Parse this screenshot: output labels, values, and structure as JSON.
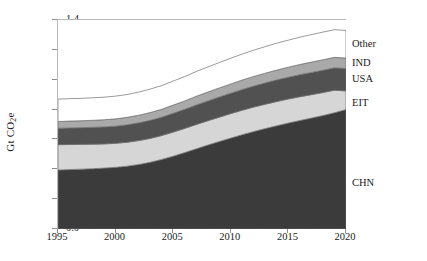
{
  "chart_data": {
    "type": "area",
    "stacked": true,
    "title": "",
    "xlabel": "",
    "ylabel": "Gt CO2e",
    "ylabel_parts": {
      "prefix": "Gt CO",
      "sub": "2",
      "suffix": "e"
    },
    "x": [
      1995,
      1996,
      1997,
      1998,
      1999,
      2000,
      2001,
      2002,
      2003,
      2004,
      2005,
      2006,
      2007,
      2008,
      2009,
      2010,
      2011,
      2012,
      2013,
      2014,
      2015,
      2016,
      2017,
      2018,
      2019,
      2020
    ],
    "xlim": [
      1995,
      2020
    ],
    "ylim": [
      0.0,
      1.4
    ],
    "xticks": [
      "1995",
      "2000",
      "2005",
      "2010",
      "2015",
      "2020"
    ],
    "xtick_values": [
      1995,
      2000,
      2005,
      2010,
      2015,
      2020
    ],
    "yticks": [
      "0.0",
      "0.2",
      "0.4",
      "0.6",
      "0.8",
      "1.0",
      "1.2",
      "1.4"
    ],
    "ytick_values": [
      0.0,
      0.2,
      0.4,
      0.6,
      0.8,
      1.0,
      1.2,
      1.4
    ],
    "grid": false,
    "legend_position": "right-inline-labels",
    "series": [
      {
        "name": "CHN",
        "color": "#3b3b3b",
        "label_value": 0.3,
        "values": [
          0.395,
          0.398,
          0.401,
          0.404,
          0.408,
          0.413,
          0.421,
          0.432,
          0.447,
          0.466,
          0.488,
          0.512,
          0.537,
          0.562,
          0.586,
          0.609,
          0.632,
          0.653,
          0.673,
          0.692,
          0.71,
          0.727,
          0.743,
          0.76,
          0.779,
          0.8
        ]
      },
      {
        "name": "EIT",
        "color": "#d6d6d6",
        "label_value": 0.835,
        "values": [
          0.17,
          0.168,
          0.166,
          0.164,
          0.162,
          0.161,
          0.16,
          0.16,
          0.16,
          0.16,
          0.161,
          0.162,
          0.163,
          0.163,
          0.163,
          0.164,
          0.164,
          0.164,
          0.163,
          0.162,
          0.161,
          0.159,
          0.157,
          0.154,
          0.151,
          0.125
        ]
      },
      {
        "name": "USA",
        "color": "#515151",
        "label_value": 1.0,
        "values": [
          0.11,
          0.111,
          0.112,
          0.113,
          0.114,
          0.115,
          0.117,
          0.119,
          0.121,
          0.123,
          0.126,
          0.128,
          0.131,
          0.133,
          0.135,
          0.137,
          0.139,
          0.141,
          0.143,
          0.145,
          0.146,
          0.148,
          0.149,
          0.15,
          0.15,
          0.15
        ]
      },
      {
        "name": "IND",
        "color": "#a9a9a9",
        "label_value": 1.105,
        "values": [
          0.045,
          0.046,
          0.046,
          0.047,
          0.048,
          0.049,
          0.05,
          0.051,
          0.052,
          0.053,
          0.055,
          0.056,
          0.058,
          0.059,
          0.061,
          0.062,
          0.063,
          0.064,
          0.065,
          0.066,
          0.067,
          0.068,
          0.069,
          0.07,
          0.07,
          0.07
        ]
      },
      {
        "name": "Other",
        "color": "#ffffff",
        "label_value": 1.235,
        "values": [
          0.15,
          0.15,
          0.15,
          0.151,
          0.151,
          0.152,
          0.153,
          0.155,
          0.157,
          0.159,
          0.161,
          0.163,
          0.166,
          0.168,
          0.17,
          0.172,
          0.174,
          0.176,
          0.178,
          0.18,
          0.181,
          0.183,
          0.184,
          0.185,
          0.185,
          0.185
        ]
      }
    ],
    "cumulative_tops": {
      "1995": {
        "CHN": 0.395,
        "EIT": 0.565,
        "USA": 0.675,
        "IND": 0.72,
        "Other": 0.87
      },
      "2000": {
        "CHN": 0.413,
        "EIT": 0.574,
        "USA": 0.689,
        "IND": 0.738,
        "Other": 0.89
      },
      "2005": {
        "CHN": 0.488,
        "EIT": 0.649,
        "USA": 0.775,
        "IND": 0.83,
        "Other": 0.991
      },
      "2010": {
        "CHN": 0.609,
        "EIT": 0.773,
        "USA": 0.91,
        "IND": 0.972,
        "Other": 1.144
      },
      "2015": {
        "CHN": 0.71,
        "EIT": 0.871,
        "USA": 1.017,
        "IND": 1.084,
        "Other": 1.265
      },
      "2020": {
        "CHN": 0.8,
        "EIT": 0.925,
        "USA": 1.075,
        "IND": 1.145,
        "Other": 1.33
      }
    },
    "axis_color": "#8f8f8f",
    "outline_color": "#6e6e6e"
  }
}
